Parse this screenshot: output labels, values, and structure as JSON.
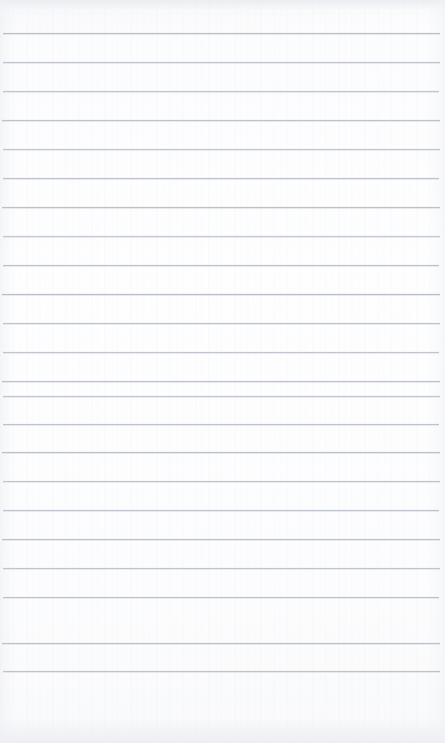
{
  "document": {
    "kind": "scanned-lined-notepad-page",
    "title": "Blank ruled notepad page",
    "content_text": "",
    "page_width": 445,
    "page_height": 743,
    "paper_color": "#fdfdfe",
    "rule_color": "#b9bdc6",
    "rule_count": 23,
    "rule_spacing_px": 29,
    "first_rule_y": 33,
    "last_rule_y": 671,
    "rule_left_x": 3,
    "rule_right_x": 440,
    "bottom_margin_note": "blank paper below final rule",
    "rules": [
      {
        "index": 1,
        "y": 33,
        "left": 3,
        "right": 440,
        "opacity": 0.95
      },
      {
        "index": 2,
        "y": 62,
        "left": 3,
        "right": 440,
        "opacity": 0.9
      },
      {
        "index": 3,
        "y": 91,
        "left": 3,
        "right": 439,
        "opacity": 0.88
      },
      {
        "index": 4,
        "y": 120,
        "left": 2,
        "right": 440,
        "opacity": 0.92
      },
      {
        "index": 5,
        "y": 149,
        "left": 3,
        "right": 440,
        "opacity": 0.86
      },
      {
        "index": 6,
        "y": 178,
        "left": 3,
        "right": 439,
        "opacity": 0.9
      },
      {
        "index": 7,
        "y": 207,
        "left": 2,
        "right": 440,
        "opacity": 0.95
      },
      {
        "index": 8,
        "y": 236,
        "left": 3,
        "right": 440,
        "opacity": 0.84
      },
      {
        "index": 9,
        "y": 265,
        "left": 3,
        "right": 439,
        "opacity": 0.9
      },
      {
        "index": 10,
        "y": 294,
        "left": 2,
        "right": 440,
        "opacity": 0.97
      },
      {
        "index": 11,
        "y": 323,
        "left": 3,
        "right": 440,
        "opacity": 0.88
      },
      {
        "index": 12,
        "y": 352,
        "left": 3,
        "right": 439,
        "opacity": 0.86
      },
      {
        "index": 13,
        "y": 381,
        "left": 2,
        "right": 440,
        "opacity": 0.92
      },
      {
        "index": 14,
        "y": 396,
        "left": 3,
        "right": 440,
        "opacity": 0.85
      },
      {
        "index": 15,
        "y": 424,
        "left": 3,
        "right": 439,
        "opacity": 0.9
      },
      {
        "index": 16,
        "y": 452,
        "left": 2,
        "right": 440,
        "opacity": 0.95
      },
      {
        "index": 17,
        "y": 481,
        "left": 3,
        "right": 440,
        "opacity": 0.87
      },
      {
        "index": 18,
        "y": 510,
        "left": 3,
        "right": 439,
        "opacity": 0.9
      },
      {
        "index": 19,
        "y": 539,
        "left": 2,
        "right": 440,
        "opacity": 0.93
      },
      {
        "index": 20,
        "y": 568,
        "left": 3,
        "right": 440,
        "opacity": 0.88
      },
      {
        "index": 21,
        "y": 597,
        "left": 3,
        "right": 439,
        "opacity": 0.9
      },
      {
        "index": 22,
        "y": 643,
        "left": 2,
        "right": 440,
        "opacity": 0.92
      },
      {
        "index": 23,
        "y": 671,
        "left": 3,
        "right": 440,
        "opacity": 0.9
      }
    ]
  }
}
